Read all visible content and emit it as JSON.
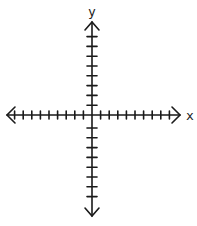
{
  "diagram": {
    "type": "coordinate-plane",
    "x_axis": {
      "label": "x",
      "ticks_left": 9,
      "ticks_right": 9,
      "arrows": "both"
    },
    "y_axis": {
      "label": "y",
      "ticks_up": 8,
      "ticks_down": 8,
      "arrows": "both"
    },
    "colors": {
      "line": "#1a1a1a",
      "background": "#ffffff"
    }
  }
}
